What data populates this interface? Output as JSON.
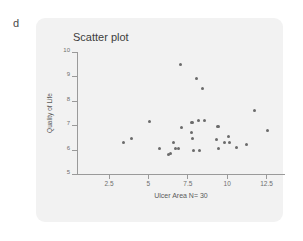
{
  "panel": {
    "label": "d"
  },
  "chart_data": {
    "type": "scatter",
    "title": "Scatter plot",
    "xlabel": "Ulcer Area N= 30",
    "ylabel": "Quality of Life",
    "xlim": [
      0.5,
      13.7
    ],
    "ylim": [
      5,
      10
    ],
    "xticks": [
      "2.5",
      "5",
      "7.5",
      "10",
      "12.5"
    ],
    "xtick_values": [
      2.5,
      5,
      7.5,
      10,
      12.5
    ],
    "yticks": [
      "5",
      "6",
      "7",
      "8",
      "9",
      "10"
    ],
    "ytick_values": [
      5,
      6,
      7,
      8,
      9,
      10
    ],
    "grid": false,
    "legend": null,
    "n": 30,
    "marker_color": "#6b6b6b",
    "points": [
      {
        "x": 3.45,
        "y": 6.3
      },
      {
        "x": 3.95,
        "y": 6.45
      },
      {
        "x": 5.1,
        "y": 7.15
      },
      {
        "x": 5.75,
        "y": 6.05
      },
      {
        "x": 6.3,
        "y": 5.8
      },
      {
        "x": 6.45,
        "y": 5.85
      },
      {
        "x": 6.6,
        "y": 6.3
      },
      {
        "x": 6.75,
        "y": 6.05
      },
      {
        "x": 6.95,
        "y": 6.05
      },
      {
        "x": 7.05,
        "y": 9.5
      },
      {
        "x": 7.15,
        "y": 6.9
      },
      {
        "x": 7.75,
        "y": 6.7
      },
      {
        "x": 7.8,
        "y": 7.1
      },
      {
        "x": 7.85,
        "y": 6.45
      },
      {
        "x": 7.9,
        "y": 5.95
      },
      {
        "x": 8.1,
        "y": 8.9
      },
      {
        "x": 8.2,
        "y": 7.2
      },
      {
        "x": 8.3,
        "y": 5.95
      },
      {
        "x": 8.45,
        "y": 8.5
      },
      {
        "x": 8.6,
        "y": 7.2
      },
      {
        "x": 9.35,
        "y": 6.4
      },
      {
        "x": 9.45,
        "y": 6.95
      },
      {
        "x": 9.5,
        "y": 6.05
      },
      {
        "x": 9.85,
        "y": 6.3
      },
      {
        "x": 10.1,
        "y": 6.55
      },
      {
        "x": 10.2,
        "y": 6.3
      },
      {
        "x": 10.6,
        "y": 6.1
      },
      {
        "x": 11.25,
        "y": 6.2
      },
      {
        "x": 11.75,
        "y": 7.6
      },
      {
        "x": 12.6,
        "y": 6.8
      }
    ]
  },
  "colors": {
    "card_background": "#f2f2f2",
    "axis": "#9a9a9a",
    "marker": "#6b6b6b",
    "title_text": "#3d3d3d",
    "label_text": "#5a5a5a"
  }
}
